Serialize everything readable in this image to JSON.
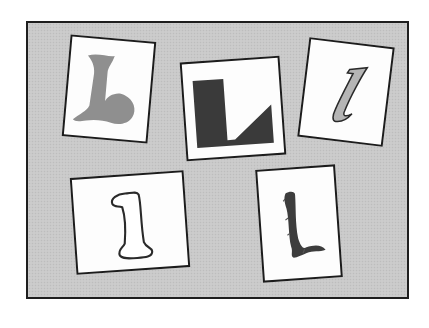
{
  "figure": {
    "background_color": "#c9c9c9",
    "border_color": "#1e1e1e",
    "card_color": "#fdfdfd"
  },
  "cards": [
    {
      "id": "card-swash-L",
      "glyph": "L",
      "style": "decorative swash, gray fill",
      "fill": "#8f8f8f",
      "rotation_deg": 5
    },
    {
      "id": "card-block-L",
      "glyph": "L",
      "style": "geometric block, dark fill",
      "fill": "#3a3a3a",
      "rotation_deg": -4
    },
    {
      "id": "card-italic-l",
      "glyph": "l",
      "style": "italic lowercase, gray fill with dark outline",
      "fill": "#b5b5b5",
      "rotation_deg": 7
    },
    {
      "id": "card-outline-l",
      "glyph": "l",
      "style": "bold outline lowercase",
      "fill": "#ffffff",
      "rotation_deg": -4
    },
    {
      "id": "card-brush-L",
      "glyph": "L",
      "style": "rough brush stroke",
      "fill": "#3d3d3d",
      "rotation_deg": -4
    }
  ]
}
